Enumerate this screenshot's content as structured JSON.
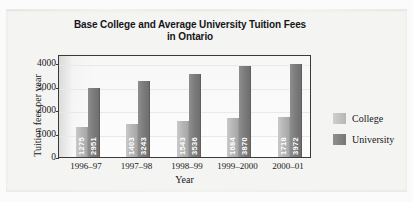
{
  "chart_data": {
    "type": "bar",
    "title": "Base College and Average University Tuition Fees in Ontario",
    "title_line1": "Base College and Average University Tuition Fees",
    "title_line2": "in Ontario",
    "xlabel": "Year",
    "ylabel": "Tuition fees per year",
    "categories": [
      "1996–97",
      "1997–98",
      "1998–99",
      "1999–2000",
      "2000–01"
    ],
    "series": [
      {
        "name": "College",
        "values": [
          1275,
          1403,
          1543,
          1684,
          1718
        ],
        "color": "#b4b4b4"
      },
      {
        "name": "University",
        "values": [
          2951,
          3243,
          3536,
          3870,
          3972
        ],
        "color": "#7a7a7a"
      }
    ],
    "ylim": [
      0,
      4400
    ],
    "yticks": [
      0,
      1000,
      2000,
      3000,
      4000
    ],
    "ytick_labels": [
      "0",
      "1000",
      "2000",
      "3000",
      "4000"
    ],
    "grid": true,
    "legend_position": "right",
    "value_labels": "inside-vertical"
  },
  "legend": {
    "items": [
      {
        "label": "College"
      },
      {
        "label": "University"
      }
    ]
  }
}
